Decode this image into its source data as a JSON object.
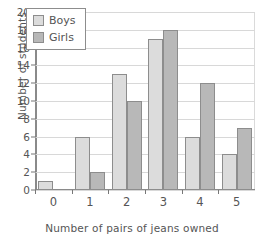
{
  "chart_data": {
    "type": "bar",
    "title": "",
    "xlabel": "Number of pairs of jeans owned",
    "ylabel": "Number of students",
    "categories": [
      "0",
      "1",
      "2",
      "3",
      "4",
      "5"
    ],
    "series": [
      {
        "name": "Boys",
        "color": "#dcdcdc",
        "values": [
          1,
          6,
          13,
          17,
          6,
          4
        ]
      },
      {
        "name": "Girls",
        "color": "#b8b8b8",
        "values": [
          0,
          2,
          10,
          18,
          12,
          7
        ]
      }
    ],
    "ylim": [
      0,
      20
    ],
    "ytick_labels": [
      "0",
      "2",
      "4",
      "6",
      "8",
      "10",
      "12",
      "14",
      "16",
      "18",
      "20"
    ],
    "ytick_values": [
      0,
      2,
      4,
      6,
      8,
      10,
      12,
      14,
      16,
      18,
      20
    ],
    "grid": true,
    "legend_position": "top-left",
    "legend_entries": [
      "Boys",
      "Girls"
    ]
  }
}
